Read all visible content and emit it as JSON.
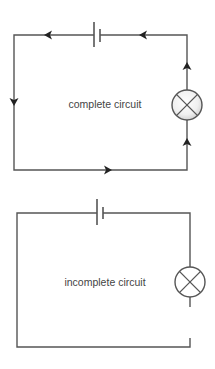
{
  "diagrams": [
    {
      "id": "complete",
      "label": "complete circuit",
      "components": [
        "battery",
        "lamp"
      ],
      "current_arrows": true,
      "closed": true
    },
    {
      "id": "incomplete",
      "label": "incomplete circuit",
      "components": [
        "battery",
        "lamp"
      ],
      "current_arrows": false,
      "closed": false
    }
  ],
  "colors": {
    "wire": "#555555",
    "arrow": "#222222",
    "text": "#444444",
    "background": "#ffffff"
  }
}
